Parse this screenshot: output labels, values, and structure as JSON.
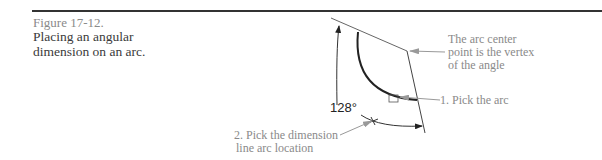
{
  "figure": {
    "number": "Figure 17-12.",
    "caption_lines": [
      "Placing an angular",
      "dimension on an arc."
    ]
  },
  "drawing": {
    "dimension_value": "128°",
    "callouts": {
      "vertex_note": [
        "The arc center",
        "point is the vertex",
        "of the angle"
      ],
      "pick_arc": "1. Pick the arc",
      "pick_location": [
        "2. Pick the dimension",
        "line arc location"
      ]
    }
  }
}
